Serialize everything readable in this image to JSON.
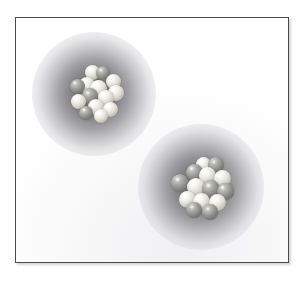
{
  "figure": {
    "width": 307,
    "height": 285,
    "background_color": "#ffffff"
  },
  "frame": {
    "name": "illustration-frame",
    "border_color": "#4a4a4d",
    "fill_color": "#ffffff",
    "left": 15,
    "top": 17,
    "width": 274,
    "height": 246,
    "shadow_color": "#78787d"
  },
  "palette": {
    "cloud_core": "#68686c",
    "cloud_mid": "#b0b0b4",
    "cloud_edge": "#ffffff",
    "nucleon_light": "#f0efe9",
    "nucleon_dark": "#8b8b87",
    "paper": "#ffffff"
  },
  "atoms": [
    {
      "id": "atom-top-left",
      "label": "Atom 1",
      "center_x": 93,
      "center_y": 93,
      "cloud_radius": 62,
      "nucleus_radius": 27,
      "nucleons": [
        {
          "type": "light",
          "x": -2,
          "y": -22,
          "r": 7.5
        },
        {
          "type": "dark",
          "x": 9,
          "y": -21,
          "r": 7.0
        },
        {
          "type": "light",
          "x": 19,
          "y": -13,
          "r": 7.5
        },
        {
          "type": "dark",
          "x": -17,
          "y": -8,
          "r": 7.5
        },
        {
          "type": "light",
          "x": -7,
          "y": -9,
          "r": 8.0
        },
        {
          "type": "light",
          "x": 4,
          "y": -6,
          "r": 8.5
        },
        {
          "type": "light",
          "x": 22,
          "y": -1,
          "r": 8.0
        },
        {
          "type": "dark",
          "x": -4,
          "y": 2,
          "r": 8.0
        },
        {
          "type": "light",
          "x": 12,
          "y": 4,
          "r": 8.0
        },
        {
          "type": "light",
          "x": -16,
          "y": 7,
          "r": 7.5
        },
        {
          "type": "light",
          "x": 2,
          "y": 13,
          "r": 8.0
        },
        {
          "type": "light",
          "x": 16,
          "y": 15,
          "r": 7.5
        },
        {
          "type": "dark",
          "x": -8,
          "y": 19,
          "r": 7.0
        },
        {
          "type": "light",
          "x": 7,
          "y": 22,
          "r": 7.0
        }
      ]
    },
    {
      "id": "atom-bottom-right",
      "label": "Atom 2",
      "center_x": 200,
      "center_y": 186,
      "cloud_radius": 63,
      "nucleus_radius": 29,
      "nucleons": [
        {
          "type": "light",
          "x": 2,
          "y": -23,
          "r": 7.5
        },
        {
          "type": "dark",
          "x": 15,
          "y": -22,
          "r": 8.0
        },
        {
          "type": "dark",
          "x": -7,
          "y": -15,
          "r": 8.5
        },
        {
          "type": "light",
          "x": 6,
          "y": -12,
          "r": 8.5
        },
        {
          "type": "light",
          "x": 21,
          "y": -9,
          "r": 8.5
        },
        {
          "type": "dark",
          "x": -21,
          "y": -4,
          "r": 9.0
        },
        {
          "type": "light",
          "x": -5,
          "y": 0,
          "r": 9.0
        },
        {
          "type": "dark",
          "x": 10,
          "y": 2,
          "r": 9.0
        },
        {
          "type": "dark",
          "x": 24,
          "y": 4,
          "r": 8.5
        },
        {
          "type": "light",
          "x": -14,
          "y": 12,
          "r": 8.5
        },
        {
          "type": "light",
          "x": 0,
          "y": 14,
          "r": 8.5
        },
        {
          "type": "light",
          "x": 16,
          "y": 15,
          "r": 8.5
        },
        {
          "type": "dark",
          "x": -7,
          "y": 23,
          "r": 8.0
        },
        {
          "type": "dark",
          "x": 9,
          "y": 25,
          "r": 8.0
        }
      ]
    }
  ]
}
